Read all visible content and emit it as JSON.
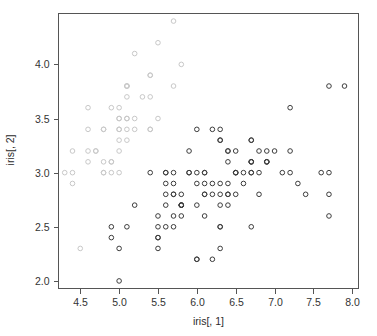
{
  "figure": {
    "background_color": "#ffffff",
    "frame_color": "#555555",
    "point_color_dark": "#3c3c3c",
    "point_color_light": "#c8c8c8"
  },
  "chart_data": {
    "type": "scatter",
    "title": "",
    "xlabel": "iris[, 1]",
    "ylabel": "iris[, 2]",
    "xlim": [
      4.22,
      8.08
    ],
    "ylim": [
      1.93,
      4.47
    ],
    "grid": false,
    "legend": null,
    "marker": "open-circle",
    "xticks": [
      4.5,
      5.0,
      5.5,
      6.0,
      6.5,
      7.0,
      7.5,
      8.0
    ],
    "xtick_labels": [
      "4.5",
      "5.0",
      "5.5",
      "6.0",
      "6.5",
      "7.0",
      "7.5",
      "8.0"
    ],
    "yticks": [
      2.0,
      2.5,
      3.0,
      3.5,
      4.0
    ],
    "ytick_labels": [
      "2.0",
      "2.5",
      "3.0",
      "3.5",
      "4.0"
    ],
    "n_points": 150,
    "x": [
      5.1,
      4.9,
      4.7,
      4.6,
      5.0,
      5.4,
      4.6,
      5.0,
      4.4,
      4.9,
      5.4,
      4.8,
      4.8,
      4.3,
      5.8,
      5.7,
      5.4,
      5.1,
      5.7,
      5.1,
      5.4,
      5.1,
      4.6,
      5.1,
      4.8,
      5.0,
      5.0,
      5.2,
      5.2,
      4.7,
      4.8,
      5.4,
      5.2,
      5.5,
      4.9,
      5.0,
      5.5,
      4.9,
      4.4,
      5.1,
      5.0,
      4.5,
      4.4,
      5.0,
      5.1,
      4.8,
      5.1,
      4.6,
      5.3,
      5.0,
      7.0,
      6.4,
      6.9,
      5.5,
      6.5,
      5.7,
      6.3,
      4.9,
      6.6,
      5.2,
      5.0,
      5.9,
      6.0,
      6.1,
      5.6,
      6.7,
      5.6,
      5.8,
      6.2,
      5.6,
      5.9,
      6.1,
      6.3,
      6.1,
      6.4,
      6.6,
      6.8,
      6.7,
      6.0,
      5.7,
      5.5,
      5.5,
      5.8,
      6.0,
      5.4,
      6.0,
      6.7,
      6.3,
      5.6,
      5.5,
      5.5,
      6.1,
      5.8,
      5.0,
      5.6,
      5.7,
      5.7,
      6.2,
      5.1,
      5.7,
      6.3,
      5.8,
      7.1,
      6.3,
      6.5,
      7.6,
      4.9,
      7.3,
      6.7,
      7.2,
      6.5,
      6.4,
      6.8,
      5.7,
      5.8,
      6.4,
      6.5,
      7.7,
      7.7,
      6.0,
      6.9,
      5.6,
      7.7,
      6.3,
      6.7,
      7.2,
      6.2,
      6.1,
      6.4,
      7.2,
      7.4,
      7.9,
      6.4,
      6.3,
      6.1,
      7.7,
      6.3,
      6.4,
      6.0,
      6.9,
      6.7,
      6.9,
      5.8,
      6.8,
      6.7,
      6.7,
      6.3,
      6.5,
      6.2,
      5.9
    ],
    "y": [
      3.5,
      3.0,
      3.2,
      3.1,
      3.6,
      3.9,
      3.4,
      3.4,
      2.9,
      3.1,
      3.7,
      3.4,
      3.0,
      3.0,
      4.0,
      4.4,
      3.9,
      3.5,
      3.8,
      3.8,
      3.4,
      3.7,
      3.6,
      3.3,
      3.4,
      3.0,
      3.4,
      3.5,
      3.4,
      3.2,
      3.1,
      3.4,
      4.1,
      4.2,
      3.1,
      3.2,
      3.5,
      3.6,
      3.0,
      3.4,
      3.5,
      2.3,
      3.2,
      3.5,
      3.8,
      3.0,
      3.8,
      3.2,
      3.7,
      3.3,
      3.2,
      3.2,
      3.1,
      2.3,
      2.8,
      2.8,
      3.3,
      2.4,
      2.9,
      2.7,
      2.0,
      3.0,
      2.2,
      2.9,
      2.9,
      3.1,
      3.0,
      2.7,
      2.2,
      2.5,
      3.2,
      2.8,
      2.5,
      2.8,
      2.9,
      3.0,
      2.8,
      3.0,
      2.9,
      2.6,
      2.4,
      2.4,
      2.7,
      2.7,
      3.0,
      3.4,
      3.1,
      2.3,
      3.0,
      2.5,
      2.6,
      3.0,
      2.6,
      2.3,
      2.7,
      3.0,
      2.9,
      2.9,
      2.5,
      2.8,
      3.3,
      2.7,
      3.0,
      2.9,
      3.0,
      3.0,
      2.5,
      2.9,
      2.5,
      3.6,
      3.2,
      2.7,
      3.0,
      2.5,
      2.8,
      3.2,
      3.0,
      3.8,
      2.6,
      2.2,
      3.2,
      2.8,
      2.8,
      2.7,
      3.3,
      3.2,
      2.8,
      3.0,
      2.8,
      3.0,
      2.8,
      3.8,
      2.8,
      2.8,
      2.6,
      3.0,
      3.4,
      3.1,
      3.0,
      3.1,
      3.1,
      3.1,
      2.7,
      3.2,
      3.3,
      3.0,
      2.5,
      3.0,
      3.4,
      3.0
    ]
  }
}
